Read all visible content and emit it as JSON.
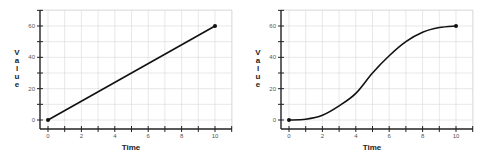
{
  "chart_data": [
    {
      "type": "line",
      "title": "",
      "xlabel": "Time",
      "ylabel": "Value",
      "x": [
        0,
        10
      ],
      "series": [
        {
          "name": "linear",
          "values": [
            0,
            60
          ]
        }
      ],
      "xlim": [
        -0.8,
        11
      ],
      "ylim": [
        -5,
        70
      ],
      "xticks": [
        0,
        2,
        4,
        6,
        8,
        10
      ],
      "yticks": [
        0,
        20,
        40,
        60
      ],
      "grid": true,
      "markers": "endpoints"
    },
    {
      "type": "line",
      "title": "",
      "xlabel": "Time",
      "ylabel": "Value",
      "x": [
        0,
        1,
        2,
        3,
        4,
        5,
        6,
        7,
        8,
        9,
        10
      ],
      "series": [
        {
          "name": "sigmoid",
          "values": [
            0,
            0.5,
            3,
            9,
            17,
            30,
            41,
            50,
            56,
            59,
            60
          ]
        }
      ],
      "xlim": [
        -0.8,
        11
      ],
      "ylim": [
        -5,
        70
      ],
      "xticks": [
        0,
        2,
        4,
        6,
        8,
        10
      ],
      "yticks": [
        0,
        20,
        40,
        60
      ],
      "grid": true,
      "markers": "endpoints"
    }
  ],
  "labels": {
    "left": {
      "xlabel": "Time",
      "ylabel": [
        "V",
        "a",
        "l",
        "u",
        "e"
      ],
      "xticks": [
        "0",
        "2",
        "4",
        "6",
        "8",
        "10"
      ],
      "yticks": [
        "0",
        "20",
        "40",
        "60"
      ]
    },
    "right": {
      "xlabel": "Time",
      "ylabel": [
        "V",
        "a",
        "l",
        "u",
        "e"
      ],
      "xticks": [
        "0",
        "2",
        "4",
        "6",
        "8",
        "10"
      ],
      "yticks": [
        "0",
        "20",
        "40",
        "60"
      ]
    }
  },
  "colors": {
    "line": "#111111",
    "grid": "#d8d8d8",
    "axis": "#222222"
  }
}
